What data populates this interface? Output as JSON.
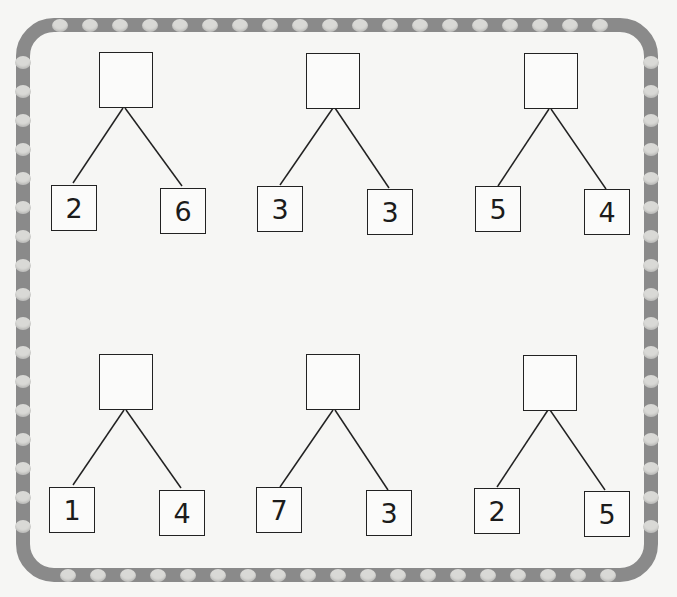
{
  "worksheet": {
    "type": "number-bond-addition",
    "border_color": "#8a8a8a",
    "dot_color": "#d9d9d6",
    "bonds": [
      {
        "whole": "",
        "left": "2",
        "right": "6"
      },
      {
        "whole": "",
        "left": "3",
        "right": "3"
      },
      {
        "whole": "",
        "left": "5",
        "right": "4"
      },
      {
        "whole": "",
        "left": "1",
        "right": "4"
      },
      {
        "whole": "",
        "left": "7",
        "right": "3"
      },
      {
        "whole": "",
        "left": "2",
        "right": "5"
      }
    ]
  }
}
